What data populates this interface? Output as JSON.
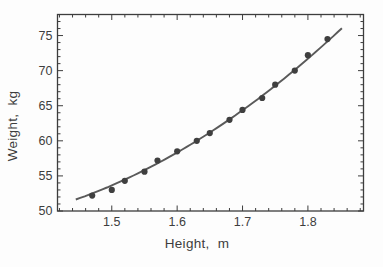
{
  "figure": {
    "background_color": "#fdfdfd"
  },
  "chart_data": {
    "type": "scatter",
    "title": "",
    "xlabel": "Height,  m",
    "ylabel": "Weight,  kg",
    "xlim": [
      1.417,
      1.885
    ],
    "ylim": [
      50,
      78
    ],
    "grid": false,
    "frame": true,
    "legend": "none",
    "x_ticks": {
      "major": [
        1.5,
        1.6,
        1.7,
        1.8
      ],
      "labels": [
        "1.5",
        "1.6",
        "1.7",
        "1.8"
      ],
      "minor_start": 1.42,
      "minor_step": 0.02
    },
    "y_ticks": {
      "major": [
        50,
        55,
        60,
        65,
        70,
        75
      ],
      "labels": [
        "50",
        "55",
        "60",
        "65",
        "70",
        "75"
      ],
      "minor_start": 51,
      "minor_step": 1
    },
    "series": [
      {
        "name": "measured-points",
        "type": "scatter",
        "x": [
          1.47,
          1.5,
          1.52,
          1.55,
          1.57,
          1.6,
          1.63,
          1.65,
          1.68,
          1.7,
          1.73,
          1.75,
          1.78,
          1.8,
          1.83
        ],
        "y": [
          52.2,
          53.0,
          54.3,
          55.6,
          57.2,
          58.5,
          60.0,
          61.1,
          63.0,
          64.4,
          66.1,
          68.0,
          70.0,
          72.2,
          74.5
        ]
      },
      {
        "name": "fit-curve",
        "type": "line",
        "model": "quadratic",
        "coefficients": {
          "a": 66.6,
          "b": -159.6,
          "c": 143.2
        },
        "x_range": [
          1.445,
          1.852
        ]
      }
    ],
    "colors": {
      "point": "#3f3f3f",
      "line": "#5a5a5a",
      "axis": "#3d3d3d",
      "background": "#fdfdfd"
    }
  }
}
